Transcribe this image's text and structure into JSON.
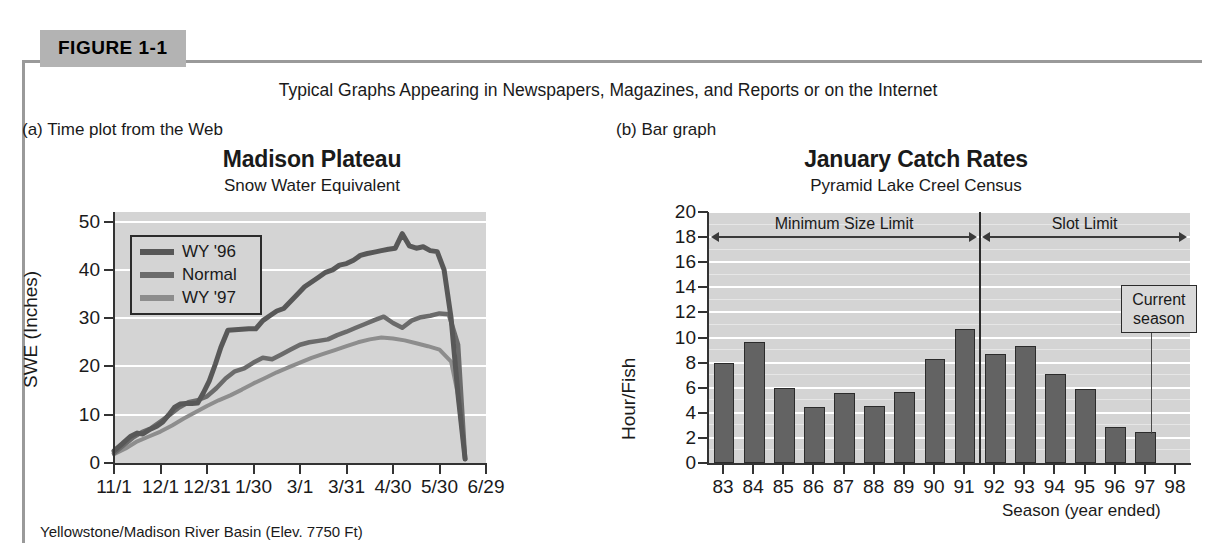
{
  "figure": {
    "tag": "FIGURE 1-1",
    "caption": "Typical Graphs Appearing in Newspapers, Magazines, and Reports or on the Internet",
    "panel_a_label": "(a) Time plot from the Web",
    "panel_b_label": "(b) Bar graph"
  },
  "chart_data": [
    {
      "type": "line",
      "panel": "a",
      "title": "Madison Plateau",
      "subtitle": "Snow Water Equivalent",
      "xlabel": "Yellowstone/Madison River Basin (Elev. 7750 Ft)",
      "ylabel": "SWE (Inches)",
      "xticklabels": [
        "11/1",
        "12/1",
        "12/31",
        "1/30",
        "3/1",
        "3/31",
        "4/30",
        "5/30",
        "6/29"
      ],
      "yticks": [
        0,
        10,
        20,
        30,
        40,
        50
      ],
      "ylim": [
        0,
        52
      ],
      "xlim": [
        0,
        8
      ],
      "grid": "horizontal-white",
      "legend_position": "upper-left",
      "plot_bg": "#d4d4d4",
      "series": [
        {
          "name": "WY '96",
          "color": "#585858",
          "x": [
            0.0,
            0.18,
            0.35,
            0.5,
            0.62,
            0.78,
            0.92,
            1.05,
            1.18,
            1.3,
            1.42,
            1.55,
            1.68,
            1.8,
            1.92,
            2.05,
            2.18,
            2.3,
            2.45,
            2.6,
            2.75,
            2.9,
            3.05,
            3.2,
            3.35,
            3.5,
            3.65,
            3.8,
            3.95,
            4.1,
            4.25,
            4.4,
            4.55,
            4.7,
            4.85,
            5.0,
            5.15,
            5.3,
            5.45,
            5.6,
            5.75,
            5.9,
            6.05,
            6.2,
            6.35,
            6.5,
            6.65,
            6.8,
            6.95,
            7.1,
            7.25,
            7.4,
            7.55
          ],
          "y": [
            2.5,
            4.0,
            5.5,
            6.2,
            6.0,
            7.0,
            7.6,
            8.5,
            10.0,
            11.5,
            12.2,
            12.3,
            12.3,
            12.4,
            14.5,
            17.0,
            20.5,
            24.0,
            27.5,
            27.6,
            27.7,
            27.8,
            27.8,
            29.5,
            30.5,
            31.5,
            32.0,
            33.5,
            35.0,
            36.5,
            37.5,
            38.5,
            39.5,
            40.0,
            41.0,
            41.3,
            42.0,
            43.0,
            43.4,
            43.7,
            44.0,
            44.3,
            44.5,
            47.5,
            45.0,
            44.5,
            44.8,
            44.0,
            43.8,
            40.0,
            30.0,
            14.0,
            0.8
          ]
        },
        {
          "name": "Normal",
          "color": "#6b6b6b",
          "x": [
            0.0,
            0.2,
            0.4,
            0.6,
            0.8,
            1.0,
            1.2,
            1.4,
            1.6,
            1.8,
            2.0,
            2.2,
            2.4,
            2.6,
            2.8,
            3.0,
            3.2,
            3.4,
            3.6,
            3.8,
            4.0,
            4.2,
            4.4,
            4.6,
            4.8,
            5.0,
            5.2,
            5.4,
            5.6,
            5.8,
            6.0,
            6.2,
            6.4,
            6.6,
            6.8,
            7.0,
            7.2,
            7.4,
            7.55
          ],
          "y": [
            2.0,
            3.6,
            5.2,
            6.4,
            7.2,
            8.6,
            10.0,
            11.5,
            12.6,
            13.0,
            13.8,
            15.5,
            17.5,
            19.0,
            19.6,
            20.8,
            21.8,
            21.5,
            22.5,
            23.5,
            24.5,
            25.0,
            25.3,
            25.6,
            26.5,
            27.2,
            28.0,
            28.8,
            29.6,
            30.3,
            29.0,
            28.0,
            29.5,
            30.2,
            30.5,
            31.0,
            30.8,
            24.5,
            0.8
          ]
        },
        {
          "name": "WY '97",
          "color": "#8d8d8d",
          "x": [
            0.0,
            0.25,
            0.5,
            0.75,
            1.0,
            1.25,
            1.5,
            1.75,
            2.0,
            2.25,
            2.5,
            2.75,
            3.0,
            3.25,
            3.5,
            3.75,
            4.0,
            4.25,
            4.5,
            4.75,
            5.0,
            5.25,
            5.5,
            5.75,
            6.0,
            6.25,
            6.5,
            6.75,
            7.0,
            7.25,
            7.4,
            7.55
          ],
          "y": [
            1.8,
            3.0,
            4.5,
            5.5,
            6.5,
            7.8,
            9.2,
            10.5,
            11.8,
            13.0,
            14.0,
            15.2,
            16.5,
            17.6,
            18.8,
            19.8,
            20.8,
            21.8,
            22.6,
            23.4,
            24.2,
            25.0,
            25.6,
            26.0,
            25.8,
            25.4,
            24.8,
            24.2,
            23.5,
            21.0,
            14.0,
            0.8
          ]
        }
      ]
    },
    {
      "type": "bar",
      "panel": "b",
      "title": "January Catch Rates",
      "subtitle": "Pyramid Lake Creel Census",
      "xlabel": "Season (year ended)",
      "ylabel": "Hour/Fish",
      "categories": [
        "83",
        "84",
        "85",
        "86",
        "87",
        "88",
        "89",
        "90",
        "91",
        "92",
        "93",
        "94",
        "95",
        "96",
        "97",
        "98"
      ],
      "values": [
        7.8,
        9.5,
        5.8,
        4.3,
        5.4,
        4.4,
        5.5,
        8.1,
        10.5,
        8.5,
        9.2,
        6.9,
        5.7,
        2.7,
        2.3,
        0
      ],
      "yticks": [
        0,
        2,
        4,
        6,
        8,
        10,
        12,
        14,
        16,
        18,
        20
      ],
      "ylim": [
        0,
        20
      ],
      "grid": "horizontal-white",
      "plot_bg": "#d4d4d4",
      "bar_color": "#636363",
      "annotations": [
        {
          "name": "minimum-size-limit",
          "text": "Minimum Size Limit",
          "from_category": "83",
          "to_category": "91",
          "y": 18
        },
        {
          "name": "slot-limit",
          "text": "Slot Limit",
          "from_category": "92",
          "to_category": "98",
          "y": 18
        },
        {
          "name": "current-season-callout",
          "text": "Current season",
          "points_to_category": "97"
        }
      ],
      "divider_between": [
        "91",
        "92"
      ]
    }
  ]
}
